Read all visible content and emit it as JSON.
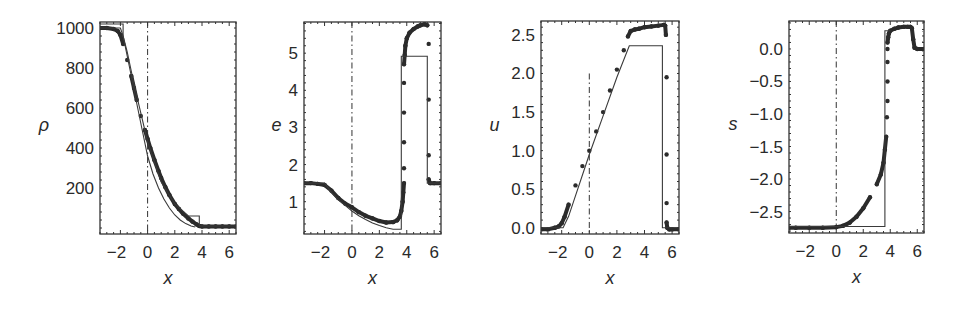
{
  "colors": {
    "data": "#2b2b2b",
    "exact": "#3a3a3a",
    "frame": "#333333",
    "background": "#ffffff"
  },
  "chart_data": [
    {
      "type": "scatter",
      "title": "",
      "xlabel": "x",
      "ylabel": "ρ",
      "xlim": [
        -3.5,
        6.5
      ],
      "ylim": [
        -30,
        1030
      ],
      "xticks": [
        -2,
        0,
        2,
        4,
        6
      ],
      "xtick_labels": [
        "−2",
        "0",
        "2",
        "4",
        "6"
      ],
      "yticks": [
        200,
        400,
        600,
        800,
        1000
      ],
      "ytick_labels": [
        "200",
        "400",
        "600",
        "800",
        "1000"
      ],
      "grid": false,
      "vline_dashdot": {
        "x": 0,
        "ymax": 1030
      },
      "frame_px": {
        "left": 100,
        "top": 22,
        "right": 236,
        "bottom": 234
      },
      "series": [
        {
          "name": "numerical",
          "style": "dots",
          "x": [
            -3.5,
            -3.0,
            -2.5,
            -2.2,
            -2.0,
            -1.8,
            -1.5,
            -1.2,
            -1.0,
            -0.8,
            -0.5,
            -0.2,
            0.0,
            0.2,
            0.5,
            0.8,
            1.0,
            1.3,
            1.6,
            2.0,
            2.3,
            2.6,
            3.0,
            3.3,
            3.6,
            3.8,
            4.0,
            4.5,
            5.0,
            5.5,
            6.0,
            6.5
          ],
          "y": [
            1000,
            1000,
            995,
            985,
            965,
            920,
            840,
            760,
            700,
            640,
            560,
            490,
            445,
            400,
            340,
            285,
            250,
            205,
            165,
            120,
            95,
            72,
            48,
            32,
            18,
            10,
            8,
            8,
            8,
            8,
            8,
            8
          ]
        },
        {
          "name": "exact-smooth",
          "style": "line",
          "x": [
            -3.5,
            -2.0,
            -1.8,
            -1.5,
            -1.2,
            -1.0,
            -0.7,
            -0.4,
            0.0,
            0.4,
            0.8,
            1.2,
            1.6,
            2.0,
            2.4,
            2.8,
            3.2,
            3.5
          ],
          "y": [
            1000,
            1000,
            960,
            860,
            760,
            690,
            590,
            490,
            360,
            270,
            200,
            145,
            100,
            65,
            40,
            22,
            10,
            5
          ]
        },
        {
          "name": "exact-step",
          "style": "line",
          "x": [
            -3.5,
            -1.8,
            -1.8,
            -1.5,
            -1.0,
            0.0,
            1.0,
            2.0,
            3.0,
            3.4,
            3.4,
            3.8,
            3.8,
            6.5
          ],
          "y": [
            1020,
            1020,
            960,
            880,
            720,
            430,
            230,
            120,
            60,
            60,
            60,
            60,
            10,
            10
          ]
        }
      ]
    },
    {
      "type": "scatter",
      "title": "",
      "xlabel": "x",
      "ylabel": "e",
      "xlim": [
        -3.5,
        6.5
      ],
      "ylim": [
        0.13,
        5.84
      ],
      "xticks": [
        -2,
        0,
        2,
        4,
        6
      ],
      "xtick_labels": [
        "−2",
        "0",
        "2",
        "4",
        "6"
      ],
      "yticks": [
        1,
        2,
        3,
        4,
        5
      ],
      "ytick_labels": [
        "1",
        "2",
        "3",
        "4",
        "5"
      ],
      "grid": false,
      "vline_dashdot": {
        "x": 0,
        "ymax": 5.84
      },
      "frame_px": {
        "left": 304,
        "top": 22,
        "right": 441,
        "bottom": 234
      },
      "series": [
        {
          "name": "numerical",
          "style": "dots",
          "x": [
            -3.5,
            -3.0,
            -2.5,
            -2.0,
            -1.5,
            -1.0,
            -0.5,
            0.0,
            0.5,
            1.0,
            1.5,
            2.0,
            2.5,
            3.0,
            3.3,
            3.5,
            3.6,
            3.7,
            3.75,
            3.8,
            3.8,
            3.8,
            3.8,
            3.8,
            3.8,
            3.85,
            3.9,
            4.0,
            4.2,
            4.5,
            4.8,
            5.0,
            5.3,
            5.5,
            5.6,
            5.6,
            5.6,
            5.6,
            5.7,
            6.0,
            6.5
          ],
          "y": [
            1.5,
            1.5,
            1.48,
            1.45,
            1.3,
            1.1,
            0.95,
            0.85,
            0.72,
            0.62,
            0.55,
            0.48,
            0.44,
            0.45,
            0.5,
            0.6,
            0.75,
            1.0,
            1.25,
            1.5,
            1.9,
            2.6,
            3.4,
            4.2,
            4.7,
            4.95,
            5.2,
            5.4,
            5.55,
            5.65,
            5.72,
            5.75,
            5.78,
            5.75,
            5.25,
            3.75,
            2.25,
            1.6,
            1.5,
            1.5,
            1.5
          ]
        },
        {
          "name": "exact",
          "style": "line",
          "x": [
            -3.5,
            -2.0,
            -1.5,
            -1.0,
            -0.5,
            0.0,
            0.5,
            1.0,
            1.5,
            2.0,
            2.5,
            3.0,
            3.6,
            3.6,
            5.5,
            5.5,
            6.5
          ],
          "y": [
            1.5,
            1.5,
            1.25,
            1.05,
            0.9,
            0.75,
            0.62,
            0.52,
            0.43,
            0.36,
            0.3,
            0.26,
            0.26,
            4.92,
            4.92,
            1.5,
            1.5
          ]
        }
      ]
    },
    {
      "type": "scatter",
      "title": "",
      "xlabel": "x",
      "ylabel": "u",
      "xlim": [
        -3.5,
        6.5
      ],
      "ylim": [
        -0.08,
        2.68
      ],
      "xticks": [
        -2,
        0,
        2,
        4,
        6
      ],
      "xtick_labels": [
        "−2",
        "0",
        "2",
        "4",
        "6"
      ],
      "yticks": [
        0.0,
        0.5,
        1.0,
        1.5,
        2.0,
        2.5
      ],
      "ytick_labels": [
        "0.0",
        "0.5",
        "1.0",
        "1.5",
        "2.0",
        "2.5"
      ],
      "grid": false,
      "vline_dashdot": {
        "x": 0,
        "ymax": 2.0
      },
      "frame_px": {
        "left": 541,
        "top": 21,
        "right": 679,
        "bottom": 234
      },
      "series": [
        {
          "name": "numerical",
          "style": "dots",
          "x": [
            -3.5,
            -3.0,
            -2.5,
            -2.2,
            -2.0,
            -1.8,
            -1.5,
            -1.0,
            -0.5,
            0.0,
            0.5,
            1.0,
            1.5,
            2.0,
            2.5,
            2.8,
            3.0,
            3.3,
            3.6,
            4.0,
            4.5,
            5.0,
            5.4,
            5.5,
            5.55,
            5.6,
            5.6,
            5.6,
            5.6,
            5.65,
            5.8,
            6.0,
            6.5
          ],
          "y": [
            -0.02,
            -0.02,
            0.0,
            0.02,
            0.06,
            0.14,
            0.3,
            0.55,
            0.8,
            1.0,
            1.25,
            1.5,
            1.78,
            2.05,
            2.3,
            2.48,
            2.55,
            2.57,
            2.58,
            2.6,
            2.61,
            2.62,
            2.63,
            2.62,
            2.5,
            1.95,
            0.95,
            0.32,
            0.07,
            0.0,
            -0.02,
            -0.02,
            -0.02
          ]
        },
        {
          "name": "exact",
          "style": "line",
          "x": [
            -3.5,
            -1.9,
            -1.5,
            0.0,
            1.0,
            2.0,
            2.9,
            5.3,
            5.3,
            6.5
          ],
          "y": [
            0.0,
            0.0,
            0.15,
            0.95,
            1.45,
            1.95,
            2.36,
            2.36,
            0.0,
            0.0
          ]
        }
      ]
    },
    {
      "type": "scatter",
      "title": "",
      "xlabel": "x",
      "ylabel": "s",
      "xlim": [
        -3.5,
        6.5
      ],
      "ylim": [
        -2.83,
        0.43
      ],
      "xticks": [
        -2,
        0,
        2,
        4,
        6
      ],
      "xtick_labels": [
        "−2",
        "0",
        "2",
        "4",
        "6"
      ],
      "yticks": [
        0.0,
        -0.5,
        -1.0,
        -1.5,
        -2.0,
        -2.5
      ],
      "ytick_labels": [
        "0.0",
        "−0.5",
        "−1.0",
        "−1.5",
        "−2.0",
        "−2.5"
      ],
      "grid": false,
      "vline_dashdot": {
        "x": 0,
        "ymax": 0.43
      },
      "vline_dotted": {
        "x": 6.4,
        "ymax": 0.43
      },
      "frame_px": {
        "left": 789,
        "top": 21,
        "right": 924,
        "bottom": 233
      },
      "series": [
        {
          "name": "numerical",
          "style": "dots",
          "x": [
            -3.5,
            -3.0,
            -2.0,
            -1.0,
            0.0,
            0.5,
            1.0,
            1.5,
            2.0,
            2.5,
            3.0,
            3.3,
            3.5,
            3.6,
            3.7,
            3.75,
            3.8,
            3.8,
            3.8,
            3.8,
            3.8,
            3.85,
            3.9,
            4.0,
            4.3,
            4.6,
            5.0,
            5.3,
            5.5,
            5.6,
            5.7,
            5.8,
            6.0,
            6.5
          ],
          "y": [
            -2.75,
            -2.75,
            -2.75,
            -2.75,
            -2.74,
            -2.72,
            -2.67,
            -2.58,
            -2.45,
            -2.28,
            -2.08,
            -1.93,
            -1.75,
            -1.55,
            -1.35,
            -1.05,
            -0.8,
            -0.5,
            -0.2,
            0.0,
            0.1,
            0.18,
            0.24,
            0.28,
            0.31,
            0.33,
            0.34,
            0.34,
            0.34,
            0.32,
            0.15,
            0.02,
            0.0,
            0.0
          ]
        },
        {
          "name": "exact",
          "style": "line",
          "x": [
            -3.5,
            3.6,
            3.6,
            4.0,
            4.0
          ],
          "y": [
            -2.73,
            -2.73,
            0.28,
            0.28,
            0.28
          ]
        }
      ]
    }
  ]
}
